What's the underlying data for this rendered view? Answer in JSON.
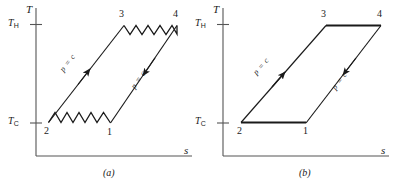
{
  "figure": {
    "type": "thermodynamic-Ts-diagram",
    "panels": [
      {
        "id": "a",
        "caption": "(a)",
        "axes": {
          "y_label": "T",
          "x_label": "s",
          "y_ticks": [
            {
              "label_main": "T",
              "label_sub": "H",
              "value": "T_H"
            },
            {
              "label_main": "T",
              "label_sub": "C",
              "value": "T_C"
            }
          ]
        },
        "states": [
          {
            "name": "1"
          },
          {
            "name": "2"
          },
          {
            "name": "3"
          },
          {
            "name": "4"
          }
        ],
        "process_labels": [
          {
            "text": "p = c",
            "path": "2-3"
          },
          {
            "text": "p = c",
            "path": "4-1"
          }
        ],
        "process_styles": {
          "2_to_1_bottom": "wavy",
          "3_to_4_top": "wavy",
          "2_to_3_left": "straight-with-arrow",
          "4_to_1_right": "straight-with-arrow"
        }
      },
      {
        "id": "b",
        "caption": "(b)",
        "axes": {
          "y_label": "T",
          "x_label": "s",
          "y_ticks": [
            {
              "label_main": "T",
              "label_sub": "H",
              "value": "T_H"
            },
            {
              "label_main": "T",
              "label_sub": "C",
              "value": "T_C"
            }
          ]
        },
        "states": [
          {
            "name": "1"
          },
          {
            "name": "2"
          },
          {
            "name": "3"
          },
          {
            "name": "4"
          }
        ],
        "process_labels": [
          {
            "text": "p = c",
            "path": "2-3"
          },
          {
            "text": "p = c",
            "path": "4-1"
          }
        ],
        "process_styles": {
          "2_to_1_bottom": "straight",
          "3_to_4_top": "straight",
          "2_to_3_left": "straight-with-arrow",
          "4_to_1_right": "straight-with-arrow"
        }
      }
    ],
    "colors": {
      "line": "#1a1a1a",
      "axis": "#4d4d4d",
      "background": "#ffffff"
    }
  }
}
